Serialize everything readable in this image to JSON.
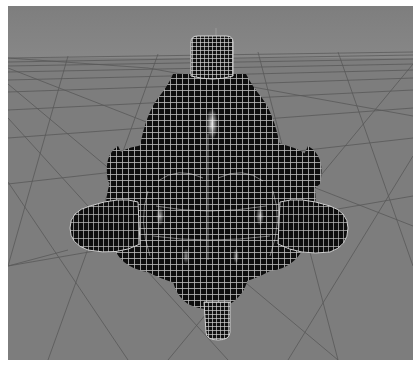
{
  "viewport": {
    "name": "3D perspective viewport",
    "background_color": "#7b7b7b",
    "sky_color": "#808080",
    "grid_color": "#4a4a4a",
    "mesh_fill_color": "#0e0e0e",
    "wireframe_color": "#e8e8e8",
    "object": {
      "description": "subdivided wireframe mesh: rounded bell body with four cylindrical side nubs, top cap cylinder and bottom cylinder",
      "parts": [
        "top-cylinder",
        "upper-bell",
        "central-lobed-body",
        "left-nub",
        "right-nub",
        "back-left-nub",
        "back-right-nub",
        "bottom-dome",
        "bottom-cylinder"
      ]
    },
    "axis_marker": "vertical pivot line above object"
  }
}
